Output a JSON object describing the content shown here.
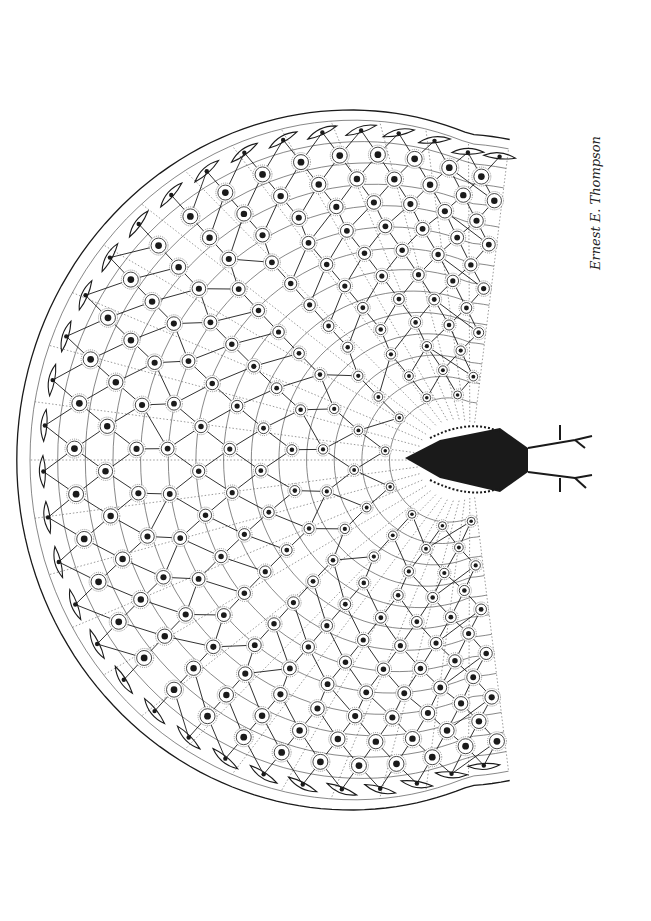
{
  "image": {
    "title": "Peacock with fully spread tail (pen-and-ink illustration)",
    "subject": "peacock",
    "view": "from behind, tail fan spread as a heart-shaped geodesic lattice",
    "medium": "black ink line drawing on white",
    "signature": "Ernest E. Thompson"
  },
  "colors": {
    "ink": "#1a1a1a",
    "paper": "#ffffff",
    "thin_line": "#555555"
  }
}
